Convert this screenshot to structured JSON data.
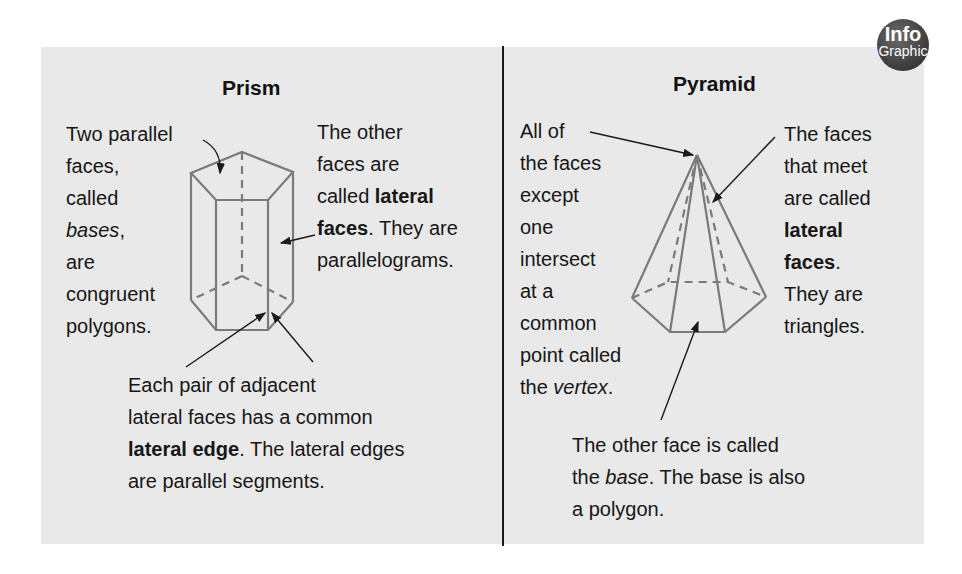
{
  "badge": {
    "line1": "Info",
    "line2": "Graphic"
  },
  "prism": {
    "title": "Prism",
    "bases_note": [
      "Two parallel",
      "faces,",
      "called",
      "bases",
      ",",
      "are",
      "congruent",
      "polygons."
    ],
    "lateral_note": {
      "l1": "The other",
      "l2": "faces are",
      "l3a": "called ",
      "l3b": "lateral",
      "l4a": "faces",
      "l4b": ". They are",
      "l5": "parallelograms."
    },
    "edge_note": {
      "l1": "Each pair of adjacent",
      "l2": "lateral faces has a common",
      "l3a": "lateral edge",
      "l3b": ". The lateral edges",
      "l4": "are parallel segments."
    }
  },
  "pyramid": {
    "title": "Pyramid",
    "vertex_note": {
      "l1": "All of",
      "l2": "the faces",
      "l3": "except",
      "l4": "one",
      "l5": "intersect",
      "l6": "at a",
      "l7": "common",
      "l8": "point called",
      "l9a": "the ",
      "l9b": "vertex",
      "l9c": "."
    },
    "lateral_note": {
      "l1": "The faces",
      "l2": "that meet",
      "l3": "are called",
      "l4": "lateral",
      "l5a": "faces",
      "l5b": ".",
      "l6": "They are",
      "l7": "triangles."
    },
    "base_note": {
      "l1": "The other face is called",
      "l2a": "the ",
      "l2b": "base",
      "l2c": ". The base is also",
      "l3": "a polygon."
    }
  },
  "colors": {
    "panel": "#e9e9e9",
    "figure_line": "#7a7a7a",
    "text": "#161616",
    "badge": "#3f3f3f"
  }
}
